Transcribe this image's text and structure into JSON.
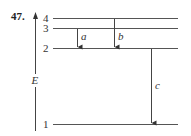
{
  "problem_number": "47.",
  "axis": {
    "label": "E"
  },
  "levels": [
    {
      "label": "4",
      "y": 18
    },
    {
      "label": "3",
      "y": 28
    },
    {
      "label": "2",
      "y": 48
    },
    {
      "label": "1",
      "y": 124
    }
  ],
  "transitions": [
    {
      "label": "a",
      "from": "3",
      "to": "2"
    },
    {
      "label": "b",
      "from": "4",
      "to": "2"
    },
    {
      "label": "c",
      "from": "2",
      "to": "1"
    }
  ]
}
